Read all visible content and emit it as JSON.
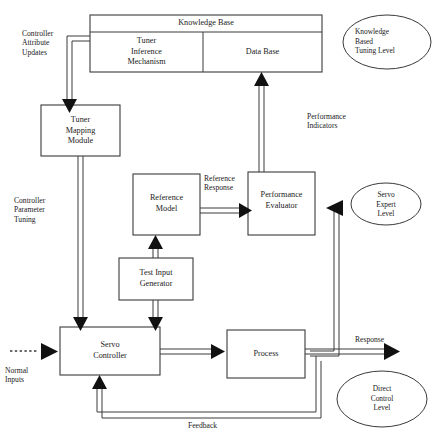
{
  "diagram": {
    "colors": {
      "line": "#3a3a3a",
      "text": "#1a1a1a",
      "background": "#ffffff"
    },
    "boxes": [
      {
        "id": "knowledge-base",
        "label": "Knowledge Base"
      },
      {
        "id": "tuner-inference",
        "label": "Tuner\nInference\nMechanism"
      },
      {
        "id": "data-base",
        "label": "Data Base"
      },
      {
        "id": "tuner-mapping-module",
        "label": "Tuner\nMapping\nModule"
      },
      {
        "id": "reference-model",
        "label": "Reference\nModel"
      },
      {
        "id": "performance-evaluator",
        "label": "Performance\nEvaluator"
      },
      {
        "id": "test-input-generator",
        "label": "Test Input\nGenerator"
      },
      {
        "id": "servo-controller",
        "label": "Servo\nController"
      },
      {
        "id": "process",
        "label": "Process"
      }
    ],
    "ellipses": [
      {
        "id": "knowledge-based-tuning-level",
        "label": "Knowledge\nBased\nTuning Level"
      },
      {
        "id": "servo-expert-level",
        "label": "Servo\nExpert\nLevel"
      },
      {
        "id": "direct-control-level",
        "label": "Direct\nControl\nLevel"
      }
    ],
    "edge_labels": [
      {
        "id": "controller-attribute-updates",
        "label": "Controller\nAttribute\nUpdates"
      },
      {
        "id": "controller-parameter-tuning",
        "label": "Controller\nParameter\nTuning"
      },
      {
        "id": "performance-indicators",
        "label": "Performance\nIndicators"
      },
      {
        "id": "reference-response",
        "label": "Reference\nResponse"
      },
      {
        "id": "normal-inputs",
        "label": "Normal\nInputs"
      },
      {
        "id": "response",
        "label": "Response"
      },
      {
        "id": "feedback",
        "label": "Feedback"
      }
    ]
  }
}
